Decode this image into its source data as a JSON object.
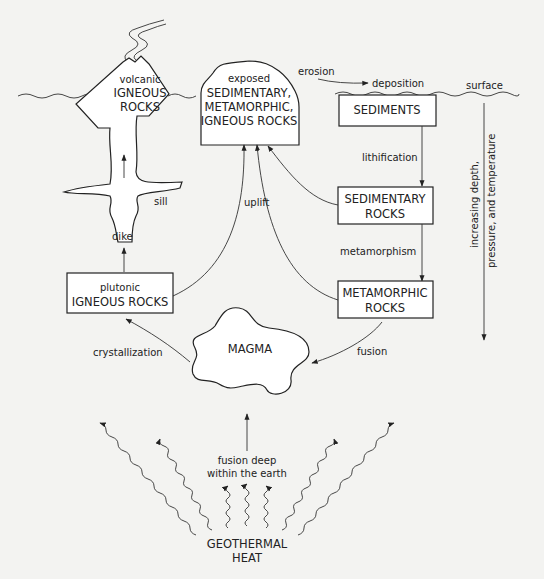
{
  "diagram": {
    "colors": {
      "background": "#f3f3f1",
      "ink": "#222222",
      "box_fill": "#ffffff"
    },
    "nodes": {
      "volcanic": {
        "line1": "volcanic",
        "line2": "IGNEOUS",
        "line3": "ROCKS"
      },
      "exposed": {
        "line1": "exposed",
        "line2": "SEDIMENTARY,",
        "line3": "METAMORPHIC,",
        "line4": "IGNEOUS ROCKS"
      },
      "sediments": {
        "line1": "SEDIMENTS"
      },
      "sedimentary": {
        "line1": "SEDIMENTARY",
        "line2": "ROCKS"
      },
      "metamorphic": {
        "line1": "METAMORPHIC",
        "line2": "ROCKS"
      },
      "plutonic": {
        "line1": "plutonic",
        "line2": "IGNEOUS ROCKS"
      },
      "magma": {
        "line1": "MAGMA"
      },
      "geothermal": {
        "line1": "GEOTHERMAL",
        "line2": "HEAT"
      }
    },
    "labels": {
      "erosion": "erosion",
      "deposition": "deposition",
      "surface": "surface",
      "lithification": "lithification",
      "metamorphism": "metamorphism",
      "fusion": "fusion",
      "uplift": "uplift",
      "sill": "sill",
      "dike": "dike",
      "crystallization": "crystallization",
      "fusion_deep_1": "fusion deep",
      "fusion_deep_2": "within the earth",
      "depth_axis_1": "increasing depth,",
      "depth_axis_2": "pressure, and temperature"
    },
    "edges": [
      {
        "from": "exposed",
        "to": "sediments",
        "label": "erosion → deposition"
      },
      {
        "from": "sediments",
        "to": "sedimentary",
        "label": "lithification"
      },
      {
        "from": "sedimentary",
        "to": "metamorphic",
        "label": "metamorphism"
      },
      {
        "from": "metamorphic",
        "to": "magma",
        "label": "fusion"
      },
      {
        "from": "magma",
        "to": "plutonic",
        "label": "crystallization"
      },
      {
        "from": "plutonic",
        "to": "volcanic",
        "label": "dike / sill"
      },
      {
        "from": "plutonic",
        "to": "exposed",
        "label": "uplift"
      },
      {
        "from": "metamorphic",
        "to": "exposed",
        "label": "uplift"
      },
      {
        "from": "sedimentary",
        "to": "exposed",
        "label": "uplift"
      },
      {
        "from": "geothermal",
        "to": "magma",
        "label": "fusion deep within the earth"
      }
    ]
  }
}
